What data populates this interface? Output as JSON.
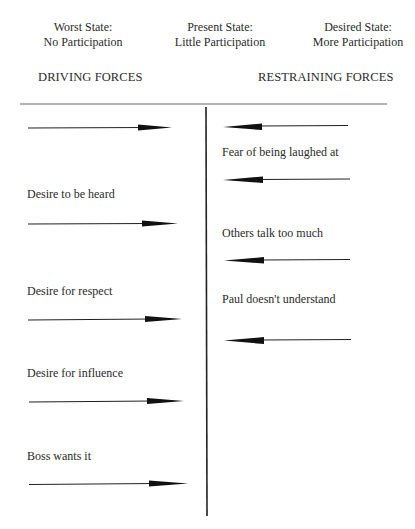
{
  "states": [
    {
      "title": "Worst State:",
      "subtitle": "No Participation"
    },
    {
      "title": "Present State:",
      "subtitle": "Little Participation"
    },
    {
      "title": "Desired State:",
      "subtitle": "More Participation"
    }
  ],
  "headings": {
    "driving": "DRIVING FORCES",
    "restraining": "RESTRAINING FORCES"
  },
  "driving_forces": [
    {
      "label": ""
    },
    {
      "label": "Desire to be heard"
    },
    {
      "label": "Desire for respect"
    },
    {
      "label": "Desire for influence"
    },
    {
      "label": "Boss wants it"
    }
  ],
  "restraining_forces": [
    {
      "label": "Fear of being laughed at"
    },
    {
      "label": "Others talk too much"
    },
    {
      "label": "Paul doesn't understand"
    }
  ],
  "colors": {
    "ink": "#1a1a1a",
    "line": "#555555"
  }
}
